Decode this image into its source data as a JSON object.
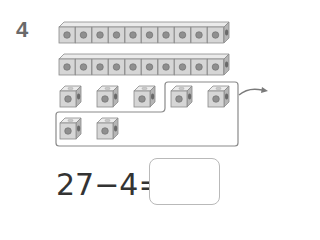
{
  "problem": {
    "number": "4",
    "rows": [
      {
        "type": "joined-bar",
        "count": 10
      },
      {
        "type": "joined-bar",
        "count": 10
      },
      {
        "type": "single-cubes",
        "count": 5
      },
      {
        "type": "single-cubes",
        "count": 2
      }
    ],
    "grouped_cubes_removed": 4,
    "equation": {
      "text": "27−4=",
      "answer": ""
    }
  }
}
